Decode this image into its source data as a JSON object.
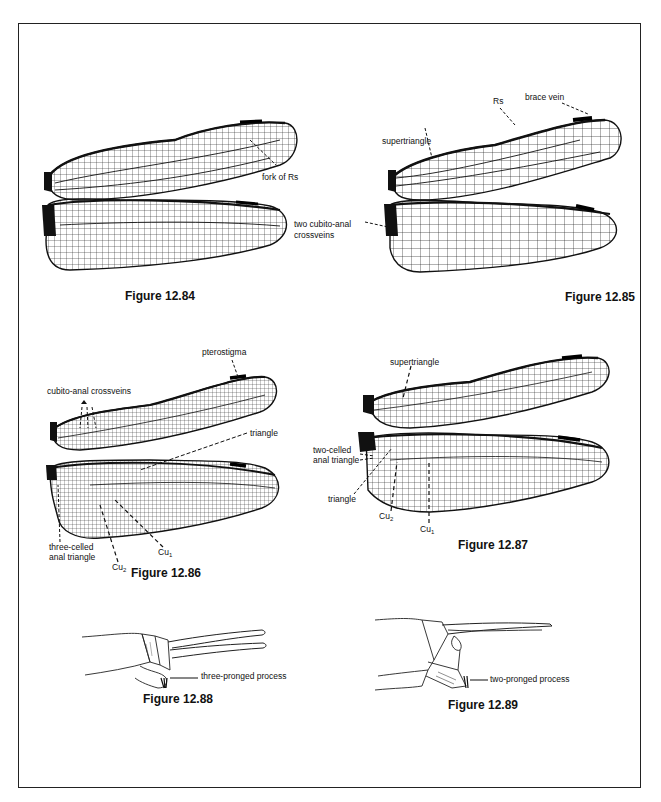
{
  "page": {
    "frame_border_color": "#222222",
    "ink_color": "#111111"
  },
  "figures": [
    {
      "id": "fig_12_84",
      "caption": "Figure 12.84",
      "subject": "forewing and hindwing",
      "labels": [
        {
          "key": "fork_of_rs",
          "text": "fork of Rs"
        }
      ]
    },
    {
      "id": "fig_12_85",
      "caption": "Figure 12.85",
      "subject": "forewing and hindwing",
      "labels": [
        {
          "key": "brace_vein",
          "text": "brace vein"
        },
        {
          "key": "rs",
          "text": "Rs"
        },
        {
          "key": "supertriangle",
          "text": "supertriangle"
        },
        {
          "key": "cubito_anal_1",
          "text": "two cubito-anal"
        },
        {
          "key": "cubito_anal_2",
          "text": "crossveins"
        }
      ]
    },
    {
      "id": "fig_12_86",
      "caption": "Figure 12.86",
      "subject": "forewing and hindwing",
      "labels": [
        {
          "key": "pterostigma",
          "text": "pterostigma"
        },
        {
          "key": "cubito_anal_crossveins",
          "text": "cubito-anal crossveins"
        },
        {
          "key": "triangle",
          "text": "triangle"
        },
        {
          "key": "three_celled_1",
          "text": "three-celled"
        },
        {
          "key": "three_celled_2",
          "text": "anal triangle"
        },
        {
          "key": "cu2_base",
          "text": "Cu",
          "sub": "2"
        },
        {
          "key": "cu1_base",
          "text": "Cu",
          "sub": "1"
        }
      ]
    },
    {
      "id": "fig_12_87",
      "caption": "Figure 12.87",
      "subject": "forewing and hindwing",
      "labels": [
        {
          "key": "supertriangle",
          "text": "supertriangle"
        },
        {
          "key": "two_celled_1",
          "text": "two-celled"
        },
        {
          "key": "two_celled_2",
          "text": "anal triangle"
        },
        {
          "key": "triangle",
          "text": "triangle"
        },
        {
          "key": "cu2_base",
          "text": "Cu",
          "sub": "2"
        },
        {
          "key": "cu1_base",
          "text": "Cu",
          "sub": "1"
        }
      ]
    },
    {
      "id": "fig_12_88",
      "caption": "Figure 12.88",
      "subject": "abdomen tip, lateral view",
      "labels": [
        {
          "key": "process",
          "text": "three-pronged process"
        }
      ]
    },
    {
      "id": "fig_12_89",
      "caption": "Figure 12.89",
      "subject": "abdomen tip, lateral view",
      "labels": [
        {
          "key": "process",
          "text": "two-pronged process"
        }
      ]
    }
  ]
}
